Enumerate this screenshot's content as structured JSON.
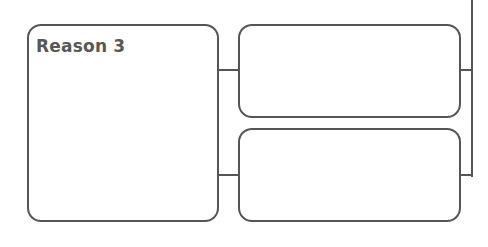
{
  "diagram": {
    "type": "graphic-organizer",
    "main_box": {
      "title": "Reason 3"
    },
    "detail_boxes": [
      {
        "label": ""
      },
      {
        "label": ""
      }
    ],
    "colors": {
      "stroke": "#555555",
      "text": "#585858",
      "background": "#ffffff"
    }
  }
}
